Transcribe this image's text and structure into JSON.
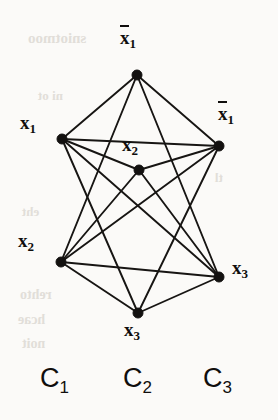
{
  "figure": {
    "width": 278,
    "height": 420,
    "background_color": "#fbfaf8",
    "ink_color": "#131110"
  },
  "graph_data": {
    "type": "node-link-diagram",
    "vertex_radius": 5,
    "vertices": [
      {
        "id": "v1",
        "label_text": "x",
        "subscript": "1",
        "negated": true,
        "x": 137,
        "y": 75,
        "clause": "C2",
        "label_x": 120,
        "label_y": 28
      },
      {
        "id": "v2",
        "label_text": "x",
        "subscript": "1",
        "negated": false,
        "x": 62,
        "y": 139,
        "clause": "C1",
        "label_x": 20,
        "label_y": 113
      },
      {
        "id": "v3",
        "label_text": "x",
        "subscript": "2",
        "negated": false,
        "x": 139,
        "y": 170,
        "clause": "C2",
        "label_x": 122,
        "label_y": 135
      },
      {
        "id": "v4",
        "label_text": "x",
        "subscript": "1",
        "negated": true,
        "x": 219,
        "y": 146,
        "clause": "C3",
        "label_x": 218,
        "label_y": 104
      },
      {
        "id": "v5",
        "label_text": "x",
        "subscript": "2",
        "negated": false,
        "x": 61,
        "y": 262,
        "clause": "C1",
        "label_x": 18,
        "label_y": 231
      },
      {
        "id": "v6",
        "label_text": "x",
        "subscript": "3",
        "negated": false,
        "x": 219,
        "y": 277,
        "clause": "C3",
        "label_x": 232,
        "label_y": 258
      },
      {
        "id": "v7",
        "label_text": "x",
        "subscript": "3",
        "negated": false,
        "x": 138,
        "y": 313,
        "clause": "C2",
        "label_x": 124,
        "label_y": 320
      }
    ],
    "edges": [
      {
        "source": "v1",
        "target": "v2"
      },
      {
        "source": "v1",
        "target": "v4"
      },
      {
        "source": "v1",
        "target": "v5"
      },
      {
        "source": "v1",
        "target": "v6"
      },
      {
        "source": "v2",
        "target": "v3"
      },
      {
        "source": "v2",
        "target": "v4"
      },
      {
        "source": "v2",
        "target": "v6"
      },
      {
        "source": "v2",
        "target": "v7"
      },
      {
        "source": "v3",
        "target": "v5"
      },
      {
        "source": "v3",
        "target": "v4"
      },
      {
        "source": "v3",
        "target": "v6"
      },
      {
        "source": "v4",
        "target": "v5"
      },
      {
        "source": "v4",
        "target": "v7"
      },
      {
        "source": "v5",
        "target": "v6"
      },
      {
        "source": "v5",
        "target": "v7"
      },
      {
        "source": "v6",
        "target": "v7"
      }
    ]
  },
  "clause_labels": [
    {
      "id": "c1",
      "text": "C",
      "subscript": "1",
      "x": 40,
      "y": 365
    },
    {
      "id": "c2",
      "text": "C",
      "subscript": "2",
      "x": 123,
      "y": 365
    },
    {
      "id": "c3",
      "text": "C",
      "subscript": "3",
      "x": 203,
      "y": 365
    }
  ],
  "bleed_text": [
    {
      "text": "sniotmoo",
      "x": 28,
      "y": 30,
      "size": 15
    },
    {
      "text": "ni ot",
      "x": 38,
      "y": 88,
      "size": 13
    },
    {
      "text": "tl",
      "x": 215,
      "y": 170,
      "size": 13
    },
    {
      "text": "eht",
      "x": 22,
      "y": 204,
      "size": 13
    },
    {
      "text": "rehto",
      "x": 20,
      "y": 287,
      "size": 14
    },
    {
      "text": "hcae",
      "x": 18,
      "y": 312,
      "size": 14
    },
    {
      "text": "noit",
      "x": 22,
      "y": 336,
      "size": 14
    }
  ]
}
